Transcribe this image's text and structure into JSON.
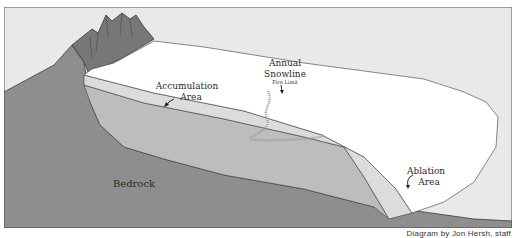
{
  "diagram": {
    "labels": {
      "accumulation_line1": "Accumulation",
      "accumulation_line2": "Area",
      "snowline_line1": "Annual",
      "snowline_line2": "Snowline",
      "firn_limit": "Firn Limit",
      "ablation_line1": "Ablation",
      "ablation_line2": "Area",
      "bedrock": "Bedrock"
    },
    "credit": "Diagram by Jon Hersh, staff",
    "colors": {
      "sky": "#e9e9e9",
      "bedrock": "#8e8e8e",
      "mountain": "#777777",
      "glacier_ice_deep": "#bdbdbd",
      "glacier_ice_light": "#dcdcdc",
      "snow": "#ffffff",
      "outline": "#3a3a3a",
      "snowline": "#9a9a9a"
    }
  }
}
